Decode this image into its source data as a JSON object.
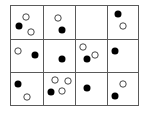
{
  "diagram": {
    "type": "grid-of-dots",
    "rows": 3,
    "cols": 4,
    "grid": {
      "x_lines": [
        10,
        43,
        75,
        107,
        138
      ],
      "y_lines": [
        5,
        39,
        72,
        105
      ],
      "line_color": "#5a5a5a",
      "line_width": 1
    },
    "dot_radius": 3.5,
    "colors": {
      "filled": "#000000",
      "hollow_fill": "#ffffff",
      "hollow_stroke": "#333333",
      "background": "#ffffff"
    },
    "cells": [
      {
        "row": 1,
        "col": 1,
        "dots": [
          {
            "type": "hollow",
            "x": 26,
            "y": 17
          },
          {
            "type": "filled",
            "x": 19,
            "y": 26
          },
          {
            "type": "hollow",
            "x": 31,
            "y": 32
          }
        ]
      },
      {
        "row": 1,
        "col": 2,
        "dots": [
          {
            "type": "hollow",
            "x": 58,
            "y": 18
          },
          {
            "type": "filled",
            "x": 62,
            "y": 30
          }
        ]
      },
      {
        "row": 1,
        "col": 3,
        "dots": []
      },
      {
        "row": 1,
        "col": 4,
        "dots": [
          {
            "type": "filled",
            "x": 118,
            "y": 14
          },
          {
            "type": "hollow",
            "x": 123,
            "y": 26
          }
        ]
      },
      {
        "row": 2,
        "col": 1,
        "dots": [
          {
            "type": "hollow",
            "x": 18,
            "y": 51
          },
          {
            "type": "filled",
            "x": 35,
            "y": 55
          }
        ]
      },
      {
        "row": 2,
        "col": 2,
        "dots": [
          {
            "type": "filled",
            "x": 62,
            "y": 59
          }
        ]
      },
      {
        "row": 2,
        "col": 3,
        "dots": [
          {
            "type": "hollow",
            "x": 83,
            "y": 47
          },
          {
            "type": "hollow",
            "x": 95,
            "y": 55
          },
          {
            "type": "filled",
            "x": 87,
            "y": 59
          }
        ]
      },
      {
        "row": 2,
        "col": 4,
        "dots": [
          {
            "type": "filled",
            "x": 115,
            "y": 51
          }
        ]
      },
      {
        "row": 3,
        "col": 1,
        "dots": [
          {
            "type": "filled",
            "x": 18,
            "y": 84
          },
          {
            "type": "hollow",
            "x": 27,
            "y": 97
          }
        ]
      },
      {
        "row": 3,
        "col": 2,
        "dots": [
          {
            "type": "hollow",
            "x": 55,
            "y": 80
          },
          {
            "type": "hollow",
            "x": 68,
            "y": 81
          },
          {
            "type": "hollow",
            "x": 62,
            "y": 91
          },
          {
            "type": "filled",
            "x": 51,
            "y": 92
          }
        ]
      },
      {
        "row": 3,
        "col": 3,
        "dots": [
          {
            "type": "filled",
            "x": 87,
            "y": 88
          }
        ]
      },
      {
        "row": 3,
        "col": 4,
        "dots": [
          {
            "type": "hollow",
            "x": 123,
            "y": 84
          },
          {
            "type": "filled",
            "x": 115,
            "y": 96
          }
        ]
      }
    ],
    "summary": {
      "filled_count": 12,
      "hollow_count": 12,
      "empty_cells": 1
    }
  }
}
